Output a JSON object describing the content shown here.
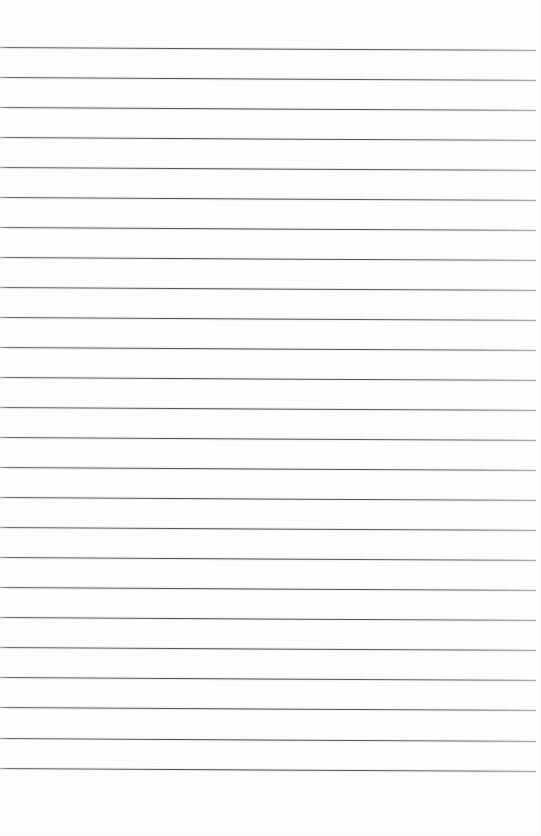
{
  "document": {
    "kind": "scanned-lined-paper",
    "title": "Blank Ruled Notebook Page",
    "page_width": 541,
    "page_height": 836,
    "background_color": "#ffffff",
    "has_text": false,
    "has_handwriting": false,
    "has_margin_rule": false,
    "orientation": "portrait"
  },
  "ruling": {
    "line_color": "#4a4a4a",
    "line_color_light": "#8a8a8a",
    "line_thickness_px": 1,
    "line_count": 25,
    "first_line_y": 47,
    "line_spacing_px": 30,
    "last_line_y": 768,
    "line_start_x": 0,
    "line_end_x": 536,
    "line_length_px": 536,
    "skew_degrees": 0.32,
    "skew_drop_px": 3
  },
  "margins": {
    "top_margin_px": 47,
    "bottom_margin_px": 68,
    "left_margin_px": 0,
    "right_margin_px": 5
  },
  "lines": [
    {
      "index": 1,
      "y": 47,
      "label": "rule-line-1"
    },
    {
      "index": 2,
      "y": 77,
      "label": "rule-line-2"
    },
    {
      "index": 3,
      "y": 107,
      "label": "rule-line-3"
    },
    {
      "index": 4,
      "y": 137,
      "label": "rule-line-4"
    },
    {
      "index": 5,
      "y": 167,
      "label": "rule-line-5"
    },
    {
      "index": 6,
      "y": 197,
      "label": "rule-line-6"
    },
    {
      "index": 7,
      "y": 227,
      "label": "rule-line-7"
    },
    {
      "index": 8,
      "y": 257,
      "label": "rule-line-8"
    },
    {
      "index": 9,
      "y": 287,
      "label": "rule-line-9"
    },
    {
      "index": 10,
      "y": 317,
      "label": "rule-line-10"
    },
    {
      "index": 11,
      "y": 347,
      "label": "rule-line-11"
    },
    {
      "index": 12,
      "y": 377,
      "label": "rule-line-12"
    },
    {
      "index": 13,
      "y": 407,
      "label": "rule-line-13"
    },
    {
      "index": 14,
      "y": 437,
      "label": "rule-line-14"
    },
    {
      "index": 15,
      "y": 467,
      "label": "rule-line-15"
    },
    {
      "index": 16,
      "y": 497,
      "label": "rule-line-16"
    },
    {
      "index": 17,
      "y": 527,
      "label": "rule-line-17"
    },
    {
      "index": 18,
      "y": 557,
      "label": "rule-line-18"
    },
    {
      "index": 19,
      "y": 587,
      "label": "rule-line-19"
    },
    {
      "index": 20,
      "y": 617,
      "label": "rule-line-20"
    },
    {
      "index": 21,
      "y": 647,
      "label": "rule-line-21"
    },
    {
      "index": 22,
      "y": 677,
      "label": "rule-line-22"
    },
    {
      "index": 23,
      "y": 707,
      "label": "rule-line-23"
    },
    {
      "index": 24,
      "y": 738,
      "label": "rule-line-24"
    },
    {
      "index": 25,
      "y": 768,
      "label": "rule-line-25"
    }
  ]
}
